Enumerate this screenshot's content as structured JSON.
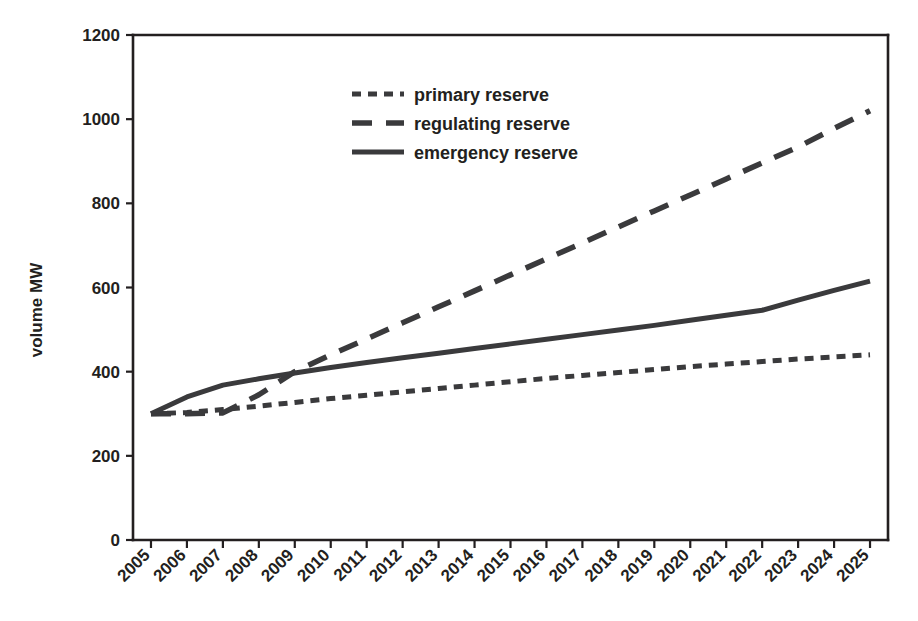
{
  "chart_data": {
    "type": "line",
    "title": "",
    "xlabel": "",
    "ylabel": "volume MW",
    "ylim": [
      0,
      1200
    ],
    "yticks": [
      0,
      200,
      400,
      600,
      800,
      1000,
      1200
    ],
    "grid": false,
    "legend_position": "top-center",
    "x": [
      "2005",
      "2006",
      "2007",
      "2008",
      "2009",
      "2010",
      "2011",
      "2012",
      "2013",
      "2014",
      "2015",
      "2016",
      "2017",
      "2018",
      "2019",
      "2020",
      "2021",
      "2022",
      "2023",
      "2024",
      "2025"
    ],
    "series": [
      {
        "name": "primary reserve",
        "style": "short-dash",
        "color": "#3a3a3c",
        "values": [
          300,
          303,
          310,
          318,
          327,
          336,
          344,
          352,
          360,
          368,
          376,
          384,
          391,
          398,
          405,
          412,
          418,
          424,
          430,
          435,
          440
        ]
      },
      {
        "name": "regulating reserve",
        "style": "long-dash",
        "color": "#3a3a3c",
        "values": [
          300,
          300,
          302,
          345,
          400,
          440,
          478,
          516,
          554,
          592,
          630,
          668,
          706,
          744,
          782,
          820,
          858,
          896,
          934,
          978,
          1020
        ]
      },
      {
        "name": "emergency reserve",
        "style": "solid",
        "color": "#3a3a3c",
        "values": [
          300,
          340,
          368,
          383,
          397,
          410,
          422,
          433,
          444,
          455,
          466,
          477,
          488,
          499,
          510,
          522,
          534,
          546,
          570,
          593,
          615
        ]
      }
    ]
  },
  "legend": {
    "items": [
      {
        "label": "primary reserve"
      },
      {
        "label": "regulating reserve"
      },
      {
        "label": "emergency reserve"
      }
    ]
  },
  "axes": {
    "y_title": "volume MW",
    "y_tick_labels": [
      "1200",
      "1000",
      "800",
      "600",
      "400",
      "200",
      "0"
    ],
    "x_tick_labels": [
      "2005",
      "2006",
      "2007",
      "2008",
      "2009",
      "2010",
      "2011",
      "2012",
      "2013",
      "2014",
      "2015",
      "2016",
      "2017",
      "2018",
      "2019",
      "2020",
      "2021",
      "2022",
      "2023",
      "2024",
      "2025"
    ]
  }
}
